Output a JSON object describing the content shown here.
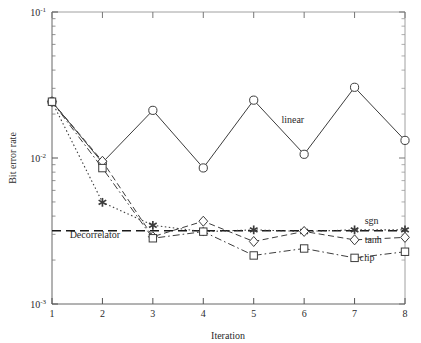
{
  "chart_data": {
    "type": "line",
    "title": "",
    "xlabel": "Iteration",
    "ylabel": "Bit error rate",
    "xlim": [
      1,
      8
    ],
    "ylim": [
      0.001,
      0.1
    ],
    "yscale": "log",
    "xscale": "linear",
    "grid": false,
    "legend_position": "inline-annotations",
    "x": [
      1,
      2,
      3,
      4,
      5,
      6,
      7,
      8
    ],
    "xtick_labels": [
      "1",
      "2",
      "3",
      "4",
      "5",
      "6",
      "7",
      "8"
    ],
    "ytick_labels": [
      "10⁻¹",
      "10⁻²",
      "10⁻³"
    ],
    "ytick_values": [
      0.1,
      0.01,
      0.001
    ],
    "ytick_mantissas": [
      "10",
      "10",
      "10"
    ],
    "ytick_exponents": [
      "-1",
      "-2",
      "-3"
    ],
    "series": [
      {
        "name": "linear",
        "marker": "circle",
        "linestyle": "solid",
        "label": "linear",
        "values": [
          0.0243,
          0.0093,
          0.0212,
          0.00855,
          0.0249,
          0.0106,
          0.0305,
          0.0132
        ]
      },
      {
        "name": "sgn",
        "marker": "star",
        "linestyle": "dotted",
        "label": "sgn",
        "values": [
          0.0243,
          0.00497,
          0.00346,
          0.00313,
          0.00322,
          0.00314,
          0.00322,
          0.00322
        ]
      },
      {
        "name": "tanh",
        "marker": "diamond",
        "linestyle": "dashed",
        "label": "tanh",
        "values": [
          0.0243,
          0.0095,
          0.00289,
          0.00369,
          0.00268,
          0.00314,
          0.00275,
          0.00286
        ]
      },
      {
        "name": "clip",
        "marker": "square",
        "linestyle": "dashdot",
        "label": "clip",
        "values": [
          0.0243,
          0.00853,
          0.00282,
          0.00313,
          0.00215,
          0.0024,
          0.00207,
          0.00228
        ]
      }
    ],
    "reference_lines": [
      {
        "name": "decorrelator",
        "label": "Decorrelator",
        "value": 0.00317,
        "linestyle": "dashed",
        "orientation": "horizontal"
      }
    ],
    "annotations": [
      {
        "text": "linear",
        "x": 5.55,
        "y": 0.0175
      },
      {
        "text": "sgn",
        "x": 7.2,
        "y": 0.00355
      },
      {
        "text": "tanh",
        "x": 7.2,
        "y": 0.00262
      },
      {
        "text": "clip",
        "x": 7.1,
        "y": 0.00197
      },
      {
        "text": "Decorrelator",
        "x": 1.35,
        "y": 0.00282
      }
    ],
    "colors": {
      "axis": "#555555",
      "line": "#3c3c3c",
      "marker_fill": "#ffffff",
      "background": "#ffffff",
      "text": "#1a1a1a"
    }
  }
}
